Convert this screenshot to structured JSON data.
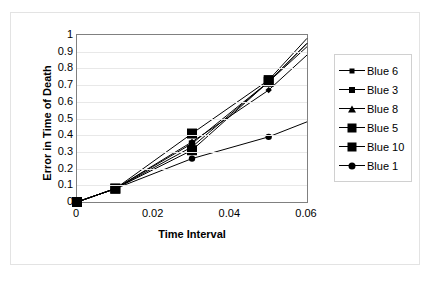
{
  "chart_data": {
    "type": "line",
    "title": "",
    "xlabel": "Time Interval",
    "ylabel": "Error in Time of Death",
    "xlim": [
      0,
      0.06
    ],
    "ylim": [
      0,
      1
    ],
    "grid": true,
    "legend_position": "right",
    "x": [
      0,
      0.01,
      0.03,
      0.05,
      0.06
    ],
    "xticks": [
      "0",
      "0.02",
      "0.04",
      "0.06"
    ],
    "xtick_values": [
      0,
      0.02,
      0.04,
      0.06
    ],
    "yticks": [
      "0",
      "0.1",
      "0.2",
      "0.3",
      "0.4",
      "0.5",
      "0.6",
      "0.7",
      "0.8",
      "0.9",
      "1"
    ],
    "ytick_values": [
      0,
      0.1,
      0.2,
      0.3,
      0.4,
      0.5,
      0.6,
      0.7,
      0.8,
      0.9,
      1
    ],
    "series": [
      {
        "name": "Blue 6",
        "marker": "diamond",
        "color": "#000000",
        "values": [
          0,
          0.08,
          0.36,
          0.67,
          0.88
        ]
      },
      {
        "name": "Blue 3",
        "marker": "square-sm",
        "color": "#000000",
        "values": [
          0,
          0.08,
          0.35,
          0.72,
          0.95
        ]
      },
      {
        "name": "Blue 8",
        "marker": "triangle",
        "color": "#000000",
        "values": [
          0,
          0.08,
          0.33,
          0.72,
          0.95
        ]
      },
      {
        "name": "Blue 5",
        "marker": "square-lg",
        "color": "#000000",
        "values": [
          0,
          0.08,
          0.41,
          0.73,
          0.98
        ]
      },
      {
        "name": "Blue 10",
        "marker": "square-lg",
        "color": "#000000",
        "values": [
          0,
          0.08,
          0.31,
          0.72,
          0.93
        ]
      },
      {
        "name": "Blue 1",
        "marker": "circle",
        "color": "#000000",
        "values": [
          0,
          0.08,
          0.26,
          0.39,
          0.48
        ]
      }
    ]
  },
  "axes": {
    "y_title": "Error in Time of Death",
    "x_title": "Time Interval"
  },
  "legend": {
    "items": [
      {
        "label": "Blue 6"
      },
      {
        "label": "Blue 3"
      },
      {
        "label": "Blue 8"
      },
      {
        "label": "Blue 5"
      },
      {
        "label": "Blue 10"
      },
      {
        "label": "Blue 1"
      }
    ]
  },
  "style": {
    "plot_border_color": "#808080",
    "gridline_color": "#e8e8e8",
    "frame_border_color": "#e3e3e3",
    "background": "#ffffff",
    "series_color": "#000000"
  }
}
